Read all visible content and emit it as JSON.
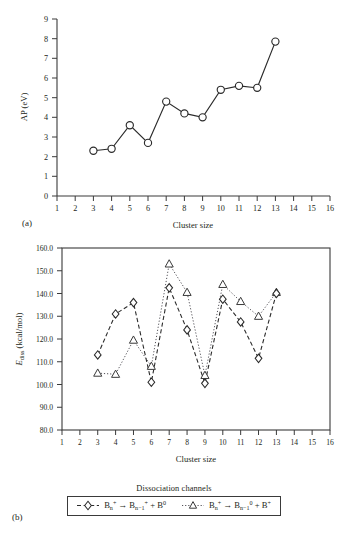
{
  "figure": {
    "panel_a_tag": "(a)",
    "panel_b_tag": "(b)"
  },
  "panel_a": {
    "ylabel": "AP (eV)",
    "xlabel": "Cluster size",
    "xticks": [
      "1",
      "2",
      "3",
      "4",
      "5",
      "6",
      "7",
      "8",
      "9",
      "10",
      "11",
      "12",
      "13",
      "14",
      "15",
      "16"
    ],
    "yticks": [
      "0",
      "1",
      "2",
      "3",
      "4",
      "5",
      "6",
      "7",
      "8",
      "9"
    ]
  },
  "panel_b": {
    "ylabel_main": "E",
    "ylabel_sub": "diss",
    "ylabel_unit": " (kcal/mol)",
    "xlabel": "Cluster size",
    "xticks": [
      "1",
      "2",
      "3",
      "4",
      "5",
      "6",
      "7",
      "8",
      "9",
      "10",
      "11",
      "12",
      "13",
      "14",
      "15",
      "16"
    ],
    "yticks": [
      "80.0",
      "90.0",
      "100.0",
      "110.0",
      "120.0",
      "130.0",
      "140.0",
      "150.0",
      "160.0"
    ],
    "legend_title": "Dissociation channels",
    "legend": [
      {
        "marker": "diamond",
        "reactant_base": "B",
        "reactant_sub": "n",
        "reactant_sup": "+",
        "arrow": "→",
        "product1_base": "B",
        "product1_sub": "n−1",
        "product1_sup": "+",
        "plus": "+",
        "product2_base": "B",
        "product2_sup": "0"
      },
      {
        "marker": "triangle",
        "reactant_base": "B",
        "reactant_sub": "n",
        "reactant_sup": "+",
        "arrow": "→",
        "product1_base": "B",
        "product1_sub": "n−1",
        "product1_sup": "0",
        "plus": "+",
        "product2_base": "B",
        "product2_sup": "+"
      }
    ]
  },
  "chart_data": [
    {
      "type": "line",
      "panel": "(a)",
      "title": "",
      "xlabel": "Cluster size",
      "ylabel": "AP (eV)",
      "xlim": [
        1,
        16
      ],
      "ylim": [
        0,
        9
      ],
      "grid": false,
      "marker": "open-circle",
      "x": [
        3,
        4,
        5,
        6,
        7,
        8,
        9,
        10,
        11,
        12,
        13
      ],
      "values": [
        2.3,
        2.4,
        3.6,
        2.7,
        4.8,
        4.2,
        4.0,
        5.4,
        5.6,
        5.5,
        7.85
      ]
    },
    {
      "type": "line",
      "panel": "(b)",
      "title": "",
      "xlabel": "Cluster size",
      "ylabel": "Ediss (kcal/mol)",
      "xlim": [
        1,
        16
      ],
      "ylim": [
        80.0,
        160.0
      ],
      "grid": false,
      "legend_position": "below",
      "x": [
        3,
        4,
        5,
        6,
        7,
        8,
        9,
        10,
        11,
        12,
        13
      ],
      "series": [
        {
          "name": "Bn+ -> Bn-1+ + B0",
          "marker": "open-diamond",
          "linestyle": "dashed",
          "values": [
            113.0,
            131.0,
            136.0,
            101.0,
            142.5,
            124.0,
            100.5,
            137.5,
            127.5,
            111.5,
            140.0
          ]
        },
        {
          "name": "Bn+ -> Bn-10 + B+",
          "marker": "open-triangle",
          "linestyle": "dotted",
          "values": [
            105.0,
            104.5,
            119.5,
            108.0,
            153.0,
            140.5,
            104.0,
            144.0,
            136.5,
            130.0,
            140.5
          ]
        }
      ]
    }
  ]
}
